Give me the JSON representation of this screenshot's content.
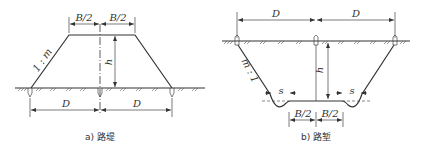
{
  "figure_a": {
    "caption": "a) 路堤",
    "top_half_left": "B/2",
    "top_half_right": "B/2",
    "slope": "1 : m",
    "height": "h",
    "dist_left": "D",
    "dist_right": "D"
  },
  "figure_b": {
    "caption": "b) 路堑",
    "dist_left": "D",
    "dist_right": "D",
    "slope": "m : 1",
    "height": "h",
    "ditch_left": "s",
    "ditch_right": "s",
    "bottom_half_left": "B/2",
    "bottom_half_right": "B/2"
  },
  "colors": {
    "line": "#333333",
    "background": "#ffffff"
  }
}
